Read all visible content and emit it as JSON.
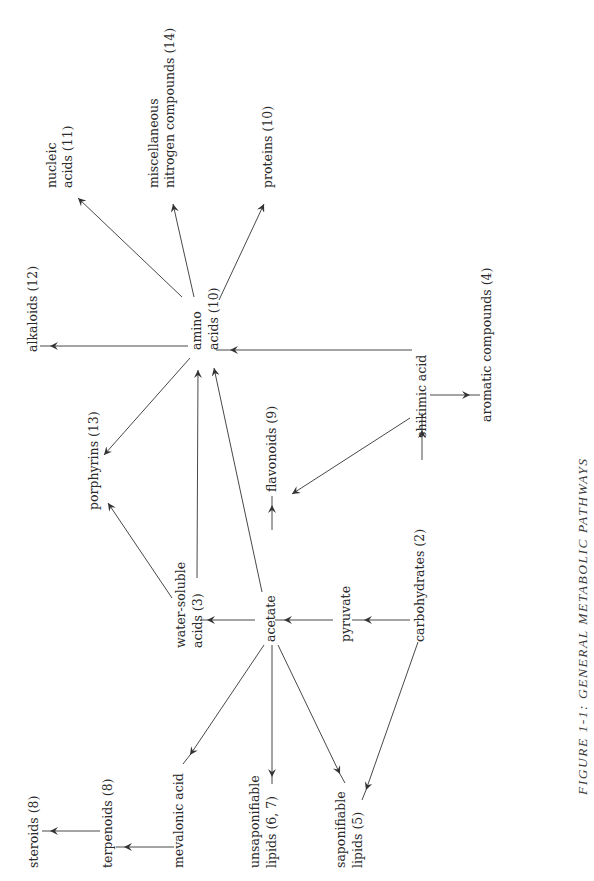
{
  "caption": "FIGURE 1-1:  GENERAL  METABOLIC  PATHWAYS",
  "nodes": {
    "steroids": "steroids (8)",
    "terpenoids": "terpenoids (8)",
    "mevalonic": "mevalonic acid",
    "unsap_1": "unsaponifiable",
    "unsap_2": "lipids (6, 7)",
    "sap_1": "saponifiable",
    "sap_2": "lipids (5)",
    "water_1": "water-soluble",
    "water_2": "acids (3)",
    "acetate": "acetate",
    "pyruvate": "pyruvate",
    "carbohydrates": "carbohydrates (2)",
    "porphyrins": "porphyrins (13)",
    "flavonoids": "flavonoids (9)",
    "shikimic": "shikimic acid",
    "aromatic": "aromatic compounds (4)",
    "alkaloids": "alkaloids (12)",
    "amino_1": "amino",
    "amino_2": "acids (10)",
    "nucleic_1": "nucleic",
    "nucleic_2": "acids (11)",
    "misc_1": "miscellaneous",
    "misc_2": "nitrogen compounds (14)",
    "proteins": "proteins (10)"
  },
  "edges": [
    {
      "from": "carbohydrates (2)",
      "to": "pyruvate"
    },
    {
      "from": "pyruvate",
      "to": "acetate"
    },
    {
      "from": "carbohydrates (2)",
      "to": "shikimic acid"
    },
    {
      "from": "carbohydrates (2)",
      "to": "saponifiable lipids (5)"
    },
    {
      "from": "acetate",
      "to": "water-soluble acids (3)"
    },
    {
      "from": "acetate",
      "to": "flavonoids (9)"
    },
    {
      "from": "acetate",
      "to": "amino acids (10)"
    },
    {
      "from": "acetate",
      "to": "mevalonic acid"
    },
    {
      "from": "acetate",
      "to": "unsaponifiable lipids (6, 7)"
    },
    {
      "from": "acetate",
      "to": "saponifiable lipids (5)"
    },
    {
      "from": "mevalonic acid",
      "to": "terpenoids (8)"
    },
    {
      "from": "terpenoids (8)",
      "to": "steroids (8)"
    },
    {
      "from": "water-soluble acids (3)",
      "to": "amino acids (10)"
    },
    {
      "from": "water-soluble acids (3)",
      "to": "porphyrins (13)"
    },
    {
      "from": "shikimic acid",
      "to": "flavonoids (9)"
    },
    {
      "from": "shikimic acid",
      "to": "amino acids (10)"
    },
    {
      "from": "shikimic acid",
      "to": "aromatic compounds (4)"
    },
    {
      "from": "amino acids (10)",
      "to": "alkaloids (12)"
    },
    {
      "from": "amino acids (10)",
      "to": "porphyrins (13)"
    },
    {
      "from": "amino acids (10)",
      "to": "nucleic acids (11)"
    },
    {
      "from": "amino acids (10)",
      "to": "miscellaneous nitrogen compounds (14)"
    },
    {
      "from": "amino acids (10)",
      "to": "proteins (10)"
    }
  ]
}
